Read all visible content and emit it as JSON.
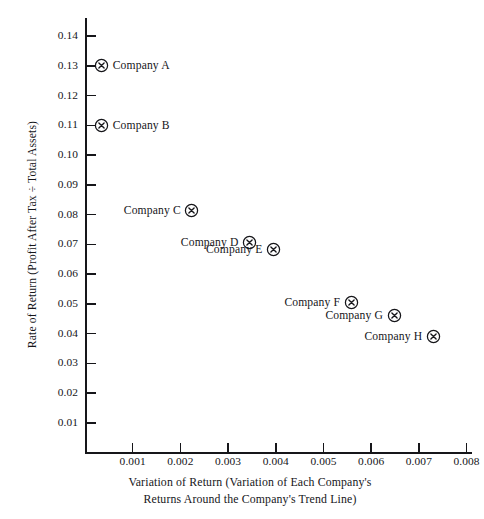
{
  "chart": {
    "type": "scatter",
    "title": "",
    "xlabel_line1": "Variation of Return (Variation of Each Company's",
    "xlabel_line2": "Returns Around the Company's Trend Line)",
    "ylabel": "Rate of Return (Profit After Tax ÷ Total Assets)",
    "xlim": [
      0.0,
      0.0081
    ],
    "ylim": [
      0.0,
      0.1455
    ],
    "grid": false,
    "legend": "none",
    "marker": "circled-x",
    "xticks": [
      0.001,
      0.002,
      0.003,
      0.004,
      0.005,
      0.006,
      0.007,
      0.008
    ],
    "xtick_labels": [
      "0.001",
      "0.002",
      "0.003",
      "0.004",
      "0.005",
      "0.006",
      "0.007",
      "0.008"
    ],
    "yticks": [
      0.01,
      0.02,
      0.03,
      0.04,
      0.05,
      0.06,
      0.07,
      0.08,
      0.09,
      0.1,
      0.11,
      0.12,
      0.13,
      0.14
    ],
    "ytick_labels": [
      "0.01",
      "0.02",
      "0.03",
      "0.04",
      "0.05",
      "0.06",
      "0.07",
      "0.08",
      "0.09",
      "0.10",
      "0.11",
      "0.12",
      "0.13",
      "0.14"
    ],
    "color": "#16161a"
  },
  "chart_data": {
    "type": "scatter",
    "title": "",
    "xlabel": "Variation of Return (Variation of Each Company's Returns Around the Company's Trend Line)",
    "ylabel": "Rate of Return (Profit After Tax ÷ Total Assets)",
    "xlim": [
      0.0,
      0.0081
    ],
    "ylim": [
      0.0,
      0.1455
    ],
    "grid": false,
    "legend": "none",
    "points": [
      {
        "label": "Company A",
        "x": 0.00035,
        "y": 0.13,
        "label_side": "right"
      },
      {
        "label": "Company B",
        "x": 0.00035,
        "y": 0.11,
        "label_side": "right"
      },
      {
        "label": "Company C",
        "x": 0.00224,
        "y": 0.0815,
        "label_side": "left"
      },
      {
        "label": "Company D",
        "x": 0.00345,
        "y": 0.0705,
        "label_side": "left"
      },
      {
        "label": "Company E",
        "x": 0.00395,
        "y": 0.0683,
        "label_side": "left"
      },
      {
        "label": "Company F",
        "x": 0.00558,
        "y": 0.0503,
        "label_side": "left"
      },
      {
        "label": "Company G",
        "x": 0.00648,
        "y": 0.0462,
        "label_side": "left"
      },
      {
        "label": "Company H",
        "x": 0.0073,
        "y": 0.039,
        "label_side": "left"
      }
    ]
  }
}
